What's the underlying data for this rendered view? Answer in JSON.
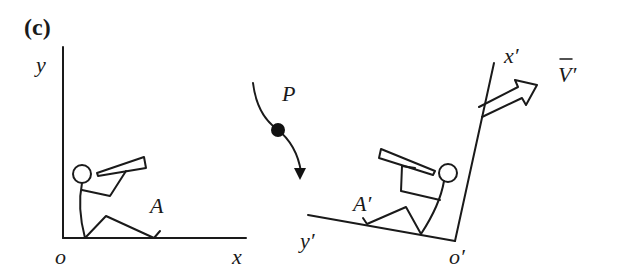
{
  "figure": {
    "panel_label": "(c)",
    "background_color": "#ffffff",
    "ink_color": "#1a1a1a",
    "left_frame": {
      "axis_x_label": "x",
      "axis_y_label": "y",
      "origin_label": "o",
      "observer_label": "A"
    },
    "particle": {
      "label": "P"
    },
    "right_frame": {
      "axis_x_label": "x′",
      "axis_y_label": "y′",
      "origin_label": "o′",
      "observer_label": "A′",
      "velocity_label": "V′"
    }
  }
}
